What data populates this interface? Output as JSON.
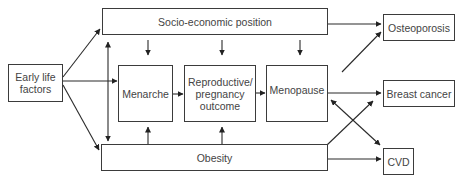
{
  "diagram": {
    "nodes": {
      "early_life": {
        "label": "Early life factors"
      },
      "sep": {
        "label": "Socio-economic position"
      },
      "menarche": {
        "label": "Menarche"
      },
      "reproductive": {
        "label": "Reproductive/ pregnancy outcome"
      },
      "menopause": {
        "label": "Menopause"
      },
      "obesity": {
        "label": "Obesity"
      },
      "osteoporosis": {
        "label": "Osteoporosis"
      },
      "breast_cancer": {
        "label": "Breast cancer"
      },
      "cvd": {
        "label": "CVD"
      }
    },
    "edges": [
      {
        "from": "Early life factors",
        "to": "Socio-economic position"
      },
      {
        "from": "Early life factors",
        "to": "Menarche"
      },
      {
        "from": "Early life factors",
        "to": "Obesity"
      },
      {
        "from": "Socio-economic position",
        "to": "Obesity",
        "bidirectional": true
      },
      {
        "from": "Socio-economic position",
        "to": "Menarche"
      },
      {
        "from": "Socio-economic position",
        "to": "Reproductive/ pregnancy outcome"
      },
      {
        "from": "Socio-economic position",
        "to": "Menopause"
      },
      {
        "from": "Socio-economic position",
        "to": "Osteoporosis"
      },
      {
        "from": "Menarche",
        "to": "Reproductive/ pregnancy outcome"
      },
      {
        "from": "Reproductive/ pregnancy outcome",
        "to": "Menopause"
      },
      {
        "from": "Obesity",
        "to": "Menarche"
      },
      {
        "from": "Obesity",
        "to": "Reproductive/ pregnancy outcome"
      },
      {
        "from": "Menopause",
        "to": "Osteoporosis"
      },
      {
        "from": "Menopause",
        "to": "Breast cancer"
      },
      {
        "from": "Menopause",
        "to": "CVD",
        "bidirectional": true
      },
      {
        "from": "Obesity",
        "to": "Breast cancer"
      },
      {
        "from": "Obesity",
        "to": "CVD"
      }
    ]
  }
}
